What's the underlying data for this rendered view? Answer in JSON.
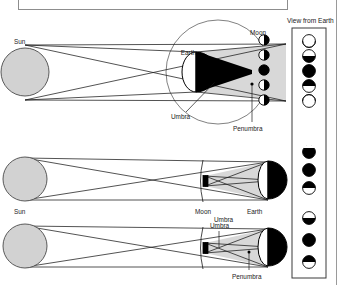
{
  "figure": {
    "title": "ECLIPSES OF THE SUN AND MOON",
    "view_panel_label": "View from Earth"
  },
  "colors": {
    "sun_fill": "#d2d2d2",
    "sun_stroke": "#4a4a4a",
    "penumbra_fill": "#d8d8d8",
    "umbra_fill": "#000000",
    "ray_stroke": "#1a1a1a",
    "orbit_stroke": "#4a4a4a",
    "body_stroke": "#000000",
    "panel_border": "#3a3a3a",
    "title_border": "#8d8d8d"
  },
  "panels": [
    {
      "id": "lunar-eclipse",
      "type": "lunar",
      "labels": {
        "sun": "Sun",
        "earth": "Earth",
        "moon": "Moon",
        "umbra": "Umbra",
        "penumbra": "Penumbra"
      },
      "moon_positions": 5,
      "view_phases": [
        "full-open",
        "upper-dark",
        "total-dark",
        "lower-dark",
        "full-open"
      ]
    },
    {
      "id": "solar-eclipse-total",
      "type": "solar",
      "labels": {
        "sun": "Sun",
        "moon": "Moon",
        "earth": "Earth",
        "umbra": "Umbra"
      },
      "view_phases": [
        "upper-dark",
        "total-dark",
        "lower-dark"
      ]
    },
    {
      "id": "solar-eclipse-penumbra",
      "type": "solar",
      "labels": {
        "umbra": "Umbra",
        "penumbra": "Penumbra"
      },
      "view_phases": [
        "upper-open",
        "total-dark",
        "lower-open"
      ]
    }
  ]
}
